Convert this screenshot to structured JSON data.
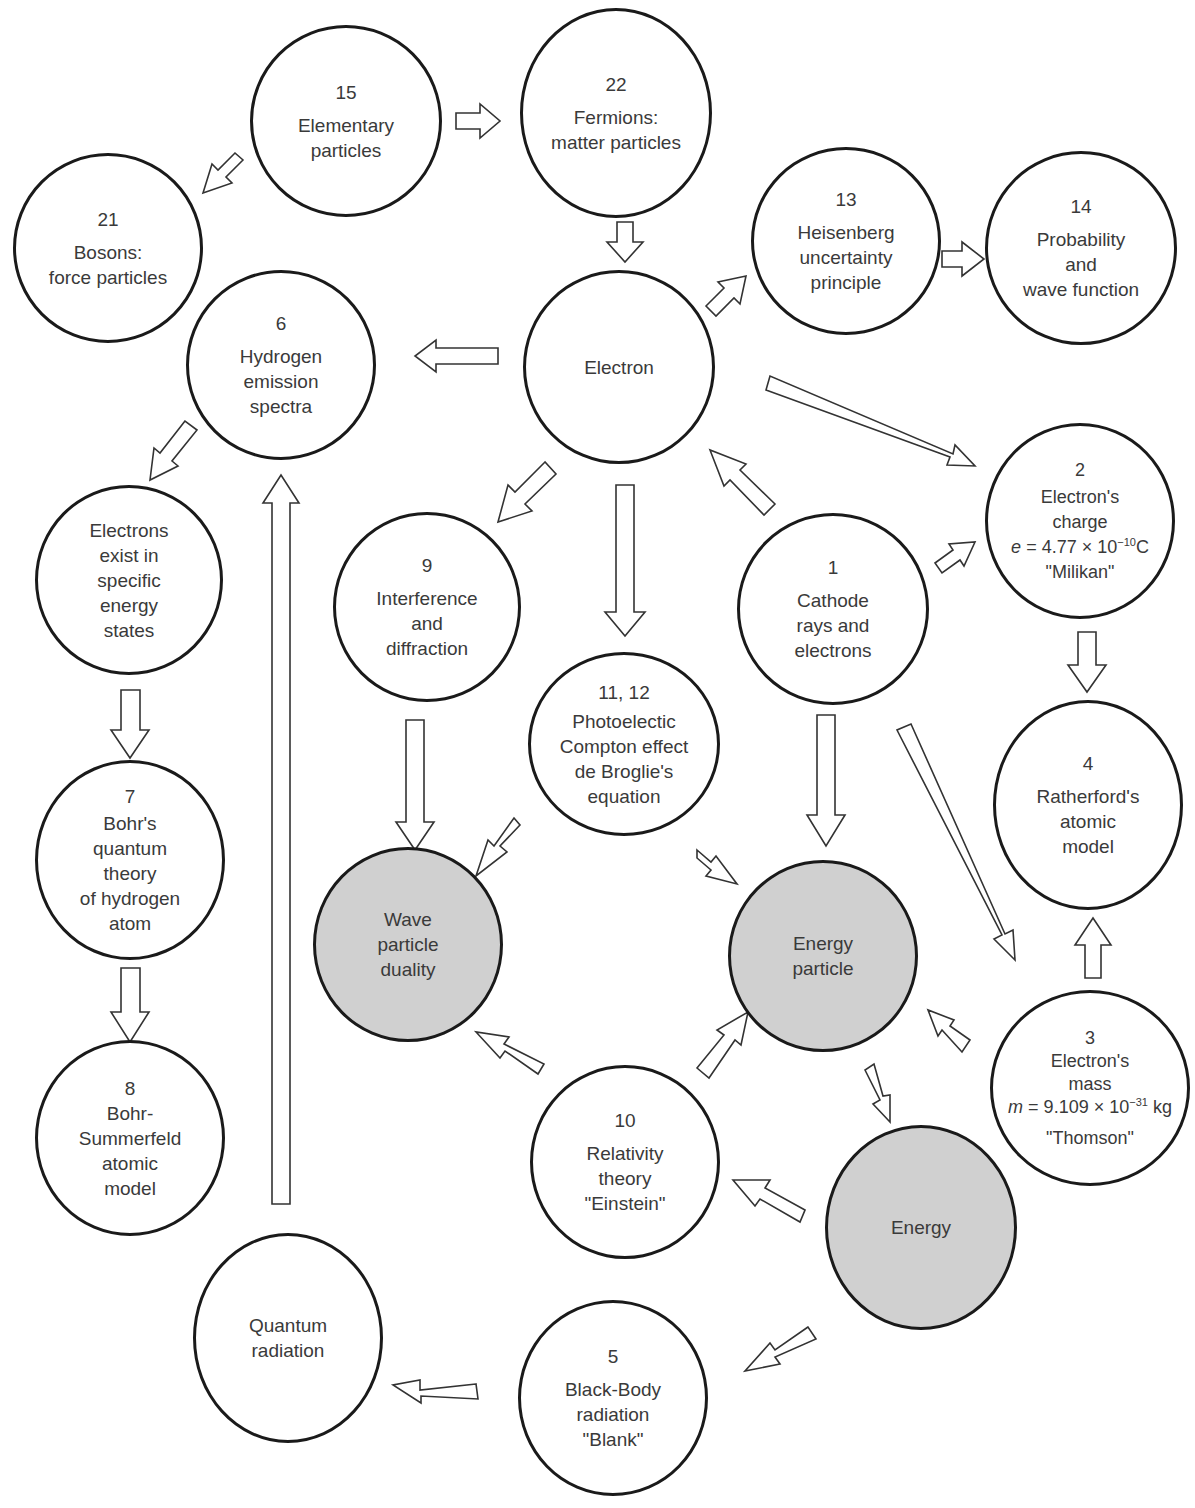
{
  "diagram": {
    "title": "",
    "nodes": [
      {
        "id": "15",
        "number": "15",
        "lines": [
          "Elementary",
          "particles"
        ],
        "shaded": false
      },
      {
        "id": "22",
        "number": "22",
        "lines": [
          "Fermions:",
          "matter particles"
        ],
        "shaded": false
      },
      {
        "id": "21",
        "number": "21",
        "lines": [
          "Bosons:",
          "force particles"
        ],
        "shaded": false
      },
      {
        "id": "13",
        "number": "13",
        "lines": [
          "Heisenberg",
          "uncertainty",
          "principle"
        ],
        "shaded": false
      },
      {
        "id": "14",
        "number": "14",
        "lines": [
          "Probability",
          "and",
          "wave function"
        ],
        "shaded": false
      },
      {
        "id": "6",
        "number": "6",
        "lines": [
          "Hydrogen",
          "emission",
          "spectra"
        ],
        "shaded": false
      },
      {
        "id": "electron",
        "number": "",
        "lines": [
          "Electron"
        ],
        "shaded": false
      },
      {
        "id": "2",
        "number": "2",
        "lines": [
          "Electron's",
          "charge"
        ],
        "formula": {
          "var": "e",
          "eq": " = 4.77 × 10",
          "exp": "−10",
          "unit": "C"
        },
        "quote": "\"Milikan\"",
        "shaded": false
      },
      {
        "id": "energy-states",
        "number": "",
        "lines": [
          "Electrons",
          "exist in",
          "specific",
          "energy",
          "states"
        ],
        "shaded": false
      },
      {
        "id": "9",
        "number": "9",
        "lines": [
          "Interference",
          "and",
          "diffraction"
        ],
        "shaded": false
      },
      {
        "id": "1",
        "number": "1",
        "lines": [
          "Cathode",
          "rays and",
          "electrons"
        ],
        "shaded": false
      },
      {
        "id": "11-12",
        "number": "11, 12",
        "lines": [
          "Photoelectic",
          "Compton effect",
          "de Broglie's",
          "equation"
        ],
        "shaded": false
      },
      {
        "id": "4",
        "number": "4",
        "lines": [
          "Ratherford's",
          "atomic",
          "model"
        ],
        "shaded": false
      },
      {
        "id": "7",
        "number": "7",
        "lines": [
          "Bohr's",
          "quantum",
          "theory",
          "of hydrogen",
          "atom"
        ],
        "shaded": false
      },
      {
        "id": "wave-particle",
        "number": "",
        "lines": [
          "Wave",
          "particle",
          "duality"
        ],
        "shaded": true
      },
      {
        "id": "energy-particle",
        "number": "",
        "lines": [
          "Energy",
          "particle"
        ],
        "shaded": true
      },
      {
        "id": "3",
        "number": "3",
        "lines": [
          "Electron's",
          "mass"
        ],
        "formula": {
          "var": "m",
          "eq": " = 9.109 × 10",
          "exp": "−31",
          "unit": " kg"
        },
        "quote": "\"Thomson\"",
        "shaded": false
      },
      {
        "id": "8",
        "number": "8",
        "lines": [
          "Bohr-",
          "Summerfeld",
          "atomic",
          "model"
        ],
        "shaded": false
      },
      {
        "id": "10",
        "number": "10",
        "lines": [
          "Relativity",
          "theory",
          "\"Einstein\""
        ],
        "shaded": false
      },
      {
        "id": "energy",
        "number": "",
        "lines": [
          "Energy"
        ],
        "shaded": true
      },
      {
        "id": "quantum-radiation",
        "number": "",
        "lines": [
          "Quantum",
          "radiation"
        ],
        "shaded": false
      },
      {
        "id": "5",
        "number": "5",
        "lines": [
          "Black-Body",
          "radiation",
          "\"Blank\""
        ],
        "shaded": false
      }
    ],
    "edges": [
      {
        "from": "15",
        "to": "22"
      },
      {
        "from": "15",
        "to": "21"
      },
      {
        "from": "22",
        "to": "electron"
      },
      {
        "from": "electron",
        "to": "13"
      },
      {
        "from": "13",
        "to": "14"
      },
      {
        "from": "electron",
        "to": "6"
      },
      {
        "from": "electron",
        "to": "2"
      },
      {
        "from": "6",
        "to": "energy-states"
      },
      {
        "from": "electron",
        "to": "9"
      },
      {
        "from": "electron",
        "to": "11-12"
      },
      {
        "from": "1",
        "to": "electron"
      },
      {
        "from": "1",
        "to": "2"
      },
      {
        "from": "2",
        "to": "4"
      },
      {
        "from": "energy-states",
        "to": "7"
      },
      {
        "from": "9",
        "to": "wave-particle"
      },
      {
        "from": "11-12",
        "to": "wave-particle"
      },
      {
        "from": "11-12",
        "to": "energy-particle"
      },
      {
        "from": "1",
        "to": "energy-particle"
      },
      {
        "from": "1",
        "to": "3"
      },
      {
        "from": "3",
        "to": "4"
      },
      {
        "from": "7",
        "to": "8"
      },
      {
        "from": "3",
        "to": "energy-particle"
      },
      {
        "from": "10",
        "to": "wave-particle"
      },
      {
        "from": "10",
        "to": "energy-particle"
      },
      {
        "from": "energy-particle",
        "to": "energy"
      },
      {
        "from": "energy",
        "to": "10"
      },
      {
        "from": "energy",
        "to": "5"
      },
      {
        "from": "5",
        "to": "quantum-radiation"
      },
      {
        "from": "quantum-radiation",
        "to": "6"
      }
    ]
  }
}
